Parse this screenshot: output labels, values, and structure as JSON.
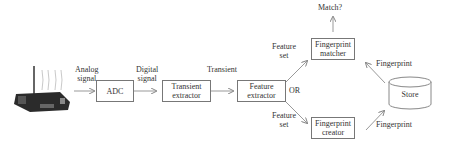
{
  "diagram": {
    "device": {
      "name": "wireless-sensor-board",
      "icon": "radio-device-icon"
    },
    "nodes": {
      "adc": "ADC",
      "transient_extractor": [
        "Transient",
        "extractor"
      ],
      "feature_extractor": [
        "Feature",
        "extractor"
      ],
      "fingerprint_matcher": [
        "Fingerprint",
        "matcher"
      ],
      "fingerprint_creator": [
        "Fingerprint",
        "creator"
      ],
      "store": "Store"
    },
    "edges": {
      "analog_signal": [
        "Analog",
        "signal"
      ],
      "digital_signal": [
        "Digital",
        "signal"
      ],
      "transient": "Transient",
      "feature_set_top": [
        "Feature",
        "set"
      ],
      "feature_set_bottom": [
        "Feature",
        "set"
      ],
      "or": "OR",
      "fingerprint_to_matcher": "Fingerprint",
      "fingerprint_from_creator": "Fingerprint",
      "match": "Match?"
    }
  }
}
